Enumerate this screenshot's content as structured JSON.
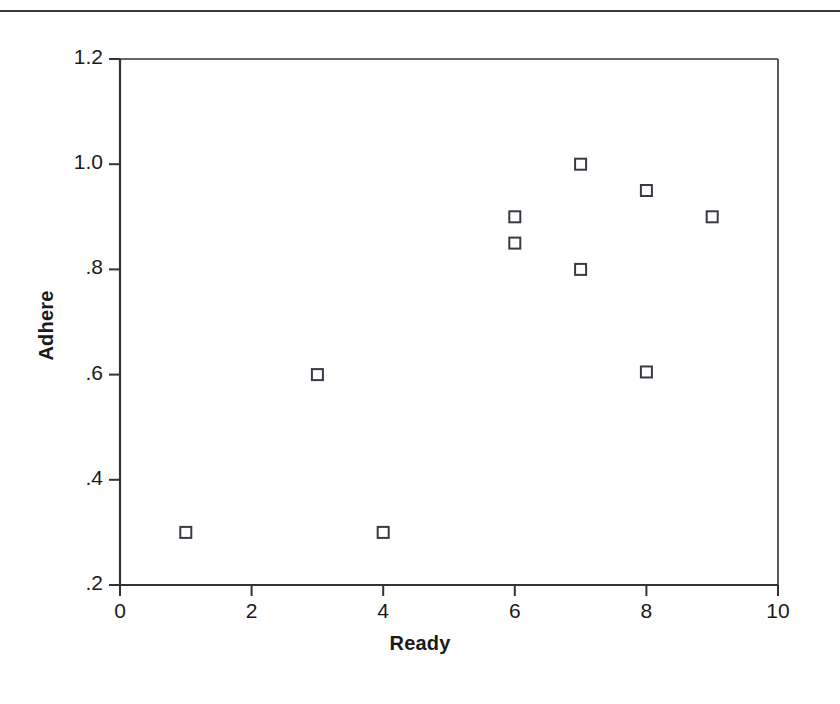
{
  "figure": {
    "has_top_rule": true,
    "background_color": "#ffffff",
    "axis_color": "#333333",
    "marker_color": "#3a3a45",
    "marker_shape": "open-square"
  },
  "chart_data": {
    "type": "scatter",
    "title": "",
    "xlabel": "Ready",
    "ylabel": "Adhere",
    "xlim": [
      0,
      10
    ],
    "ylim": [
      0.2,
      1.2
    ],
    "xticks": [
      0,
      2,
      4,
      6,
      8,
      10
    ],
    "xtick_labels": [
      "0",
      "2",
      "4",
      "6",
      "8",
      "10"
    ],
    "yticks": [
      0.2,
      0.4,
      0.6,
      0.8,
      1.0,
      1.2
    ],
    "ytick_labels": [
      ".2",
      ".4",
      ".6",
      ".8",
      "1.0",
      "1.2"
    ],
    "grid": false,
    "legend": null,
    "series": [
      {
        "name": "Adhere vs Ready",
        "marker": "open-square",
        "points": [
          {
            "x": 1,
            "y": 0.3
          },
          {
            "x": 3,
            "y": 0.6
          },
          {
            "x": 4,
            "y": 0.3
          },
          {
            "x": 6,
            "y": 0.9
          },
          {
            "x": 6,
            "y": 0.85
          },
          {
            "x": 7,
            "y": 1.0
          },
          {
            "x": 7,
            "y": 0.8
          },
          {
            "x": 8,
            "y": 0.95
          },
          {
            "x": 8,
            "y": 0.605
          },
          {
            "x": 9,
            "y": 0.9
          }
        ]
      }
    ]
  }
}
